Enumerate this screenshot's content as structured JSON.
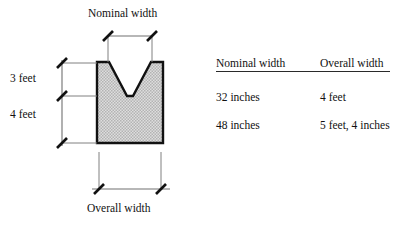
{
  "diagram": {
    "nominal_width_label": "Nominal width",
    "overall_width_label": "Overall width",
    "height_upper_label": "3 feet",
    "height_lower_label": "4 feet",
    "shape_name": "u-shaped-channel-cross-section",
    "colors": {
      "outline": "#111111",
      "fill": "#d4d4d4",
      "dimension_line": "#666666",
      "tick": "#111111",
      "cavity": "#ffffff",
      "background": "#ffffff"
    }
  },
  "table": {
    "headers": [
      "Nominal width",
      "Overall width"
    ],
    "rows": [
      {
        "nominal_width": "32 inches",
        "overall_width": "4 feet"
      },
      {
        "nominal_width": "48 inches",
        "overall_width": "5 feet, 4 inches"
      }
    ]
  }
}
